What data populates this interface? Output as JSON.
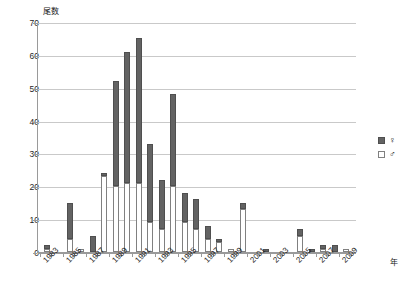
{
  "chart_data": {
    "type": "bar",
    "title": "",
    "subtitle": "",
    "ylabel": "尾数",
    "xlabel": "年",
    "ylim": [
      0,
      70
    ],
    "yticks": [
      0,
      10,
      20,
      30,
      40,
      50,
      60,
      70
    ],
    "grid": true,
    "stacked": true,
    "legend_position": "right",
    "categories": [
      "1983",
      "1984",
      "1985",
      "1986",
      "1987",
      "1988",
      "1989",
      "1990",
      "1991",
      "1992",
      "1993",
      "1994",
      "1995",
      "1996",
      "1997",
      "1998",
      "1999",
      "2000",
      "2001",
      "2002",
      "2003",
      "2004",
      "2005",
      "2006",
      "2007",
      "2008",
      "2009"
    ],
    "xtick_labels": [
      "1983",
      "1985",
      "1987",
      "1989",
      "1991",
      "1993",
      "1995",
      "1997",
      "1999",
      "2001",
      "2003",
      "2005",
      "2007",
      "2009"
    ],
    "series": [
      {
        "name": "♂",
        "color": "#ffffff",
        "values": [
          1,
          0,
          4,
          1,
          0,
          23,
          20,
          21,
          21,
          9,
          7,
          20,
          9,
          7,
          4,
          3,
          1,
          13,
          0,
          0,
          0,
          0,
          5,
          0,
          1,
          0,
          1
        ]
      },
      {
        "name": "♀",
        "color": "#636363",
        "values": [
          1,
          0,
          11,
          0,
          5,
          1,
          32,
          40,
          44,
          24,
          15,
          28,
          9,
          9,
          4,
          1,
          0,
          2,
          0,
          1,
          0,
          0,
          2,
          1,
          1,
          2,
          0
        ]
      }
    ],
    "totals": [
      2,
      0,
      15,
      1,
      5,
      24,
      52,
      61,
      65,
      33,
      22,
      48,
      18,
      16,
      8,
      4,
      1,
      15,
      0,
      1,
      0,
      0,
      7,
      1,
      2,
      2,
      1
    ]
  },
  "legend": {
    "items": [
      {
        "label": "♀",
        "swatch": "filled-dark-square"
      },
      {
        "label": "♂",
        "swatch": "empty-white-square"
      }
    ]
  },
  "axis": {
    "y_title": "尾数",
    "x_title": "年"
  }
}
